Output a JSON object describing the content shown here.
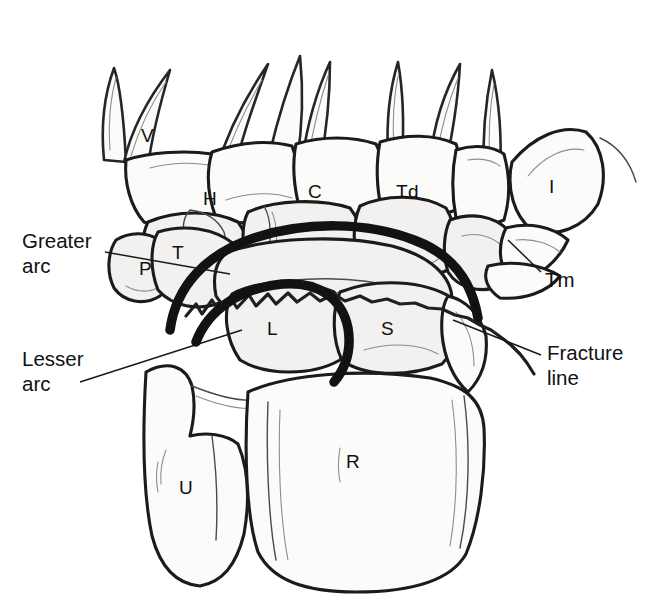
{
  "figure": {
    "colors": {
      "arc_line": "#121212",
      "bone_outline": "#1b1b1b",
      "bone_fill": "#fbfbfa",
      "background": "#ffffff",
      "leader_line": "#1a1a1a"
    }
  },
  "bone_labels": [
    {
      "id": "metacarpal-five",
      "text": "V",
      "x": 141,
      "y": 126
    },
    {
      "id": "hamate",
      "text": "H",
      "x": 203,
      "y": 189
    },
    {
      "id": "capitate",
      "text": "C",
      "x": 308,
      "y": 182
    },
    {
      "id": "trapezoid",
      "text": "Td",
      "x": 396,
      "y": 182
    },
    {
      "id": "metacarpal-one",
      "text": "I",
      "x": 549,
      "y": 177
    },
    {
      "id": "triquetrum",
      "text": "T",
      "x": 172,
      "y": 243
    },
    {
      "id": "pisiform",
      "text": "P",
      "x": 139,
      "y": 259
    },
    {
      "id": "lunate",
      "text": "L",
      "x": 267,
      "y": 319
    },
    {
      "id": "scaphoid",
      "text": "S",
      "x": 381,
      "y": 319
    },
    {
      "id": "ulna",
      "text": "U",
      "x": 179,
      "y": 478
    },
    {
      "id": "radius",
      "text": "R",
      "x": 346,
      "y": 452
    }
  ],
  "callouts": [
    {
      "id": "greater-arc",
      "text": "Greater\narc",
      "x": 22,
      "y": 228,
      "side": "left",
      "leader": {
        "x1": 105,
        "y1": 252,
        "x2": 230,
        "y2": 274
      }
    },
    {
      "id": "lesser-arc",
      "text": "Lesser\narc",
      "x": 22,
      "y": 346,
      "side": "left",
      "leader": {
        "x1": 80,
        "y1": 382,
        "x2": 242,
        "y2": 330
      }
    },
    {
      "id": "trapezium",
      "text": "Tm",
      "x": 545,
      "y": 267,
      "side": "right",
      "leader": {
        "x1": 541,
        "y1": 272,
        "x2": 508,
        "y2": 240
      }
    },
    {
      "id": "fracture-line",
      "text": "Fracture\nline",
      "x": 547,
      "y": 340,
      "side": "right",
      "leader": {
        "x1": 541,
        "y1": 355,
        "x2": 453,
        "y2": 320
      }
    }
  ],
  "anatomy_legend": {
    "V": "Fifth metacarpal",
    "H": "Hamate",
    "C": "Capitate",
    "Td": "Trapezoid",
    "Tm": "Trapezium",
    "I": "First metacarpal",
    "T": "Triquetrum",
    "P": "Pisiform",
    "L": "Lunate",
    "S": "Scaphoid",
    "U": "Ulna",
    "R": "Radius"
  }
}
